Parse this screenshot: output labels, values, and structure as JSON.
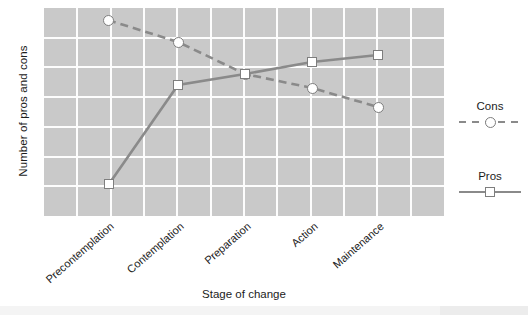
{
  "chart_data": {
    "type": "line",
    "title": "",
    "xlabel": "Stage of change",
    "ylabel": "Number of pros and cons",
    "categories": [
      "Precontemplation",
      "Contemplation",
      "Preparation",
      "Action",
      "Maintenance"
    ],
    "grid": true,
    "grid_color": "#fdfdfd",
    "plot_background": "#c9c9c9",
    "legend_position": "right",
    "ylim": [
      0,
      7
    ],
    "yticks_visible": false,
    "series": [
      {
        "name": "Cons",
        "style": "dashed",
        "marker": "circle",
        "color": "#8a8a8a",
        "values": [
          6.6,
          5.85,
          4.8,
          4.3,
          3.65
        ],
        "points_px": [
          {
            "x": 108,
            "y": 20
          },
          {
            "x": 178,
            "y": 42
          },
          {
            "x": 245,
            "y": 74
          },
          {
            "x": 312,
            "y": 88
          },
          {
            "x": 378,
            "y": 107
          }
        ]
      },
      {
        "name": "Pros",
        "style": "solid",
        "marker": "square",
        "color": "#8a8a8a",
        "values": [
          0.95,
          4.4,
          4.8,
          5.2,
          5.45
        ],
        "points_px": [
          {
            "x": 109,
            "y": 184
          },
          {
            "x": 178,
            "y": 85
          },
          {
            "x": 245,
            "y": 74
          },
          {
            "x": 312,
            "y": 62
          },
          {
            "x": 378,
            "y": 55
          }
        ]
      }
    ]
  },
  "axes": {
    "y_title": "Number of pros and cons",
    "x_title": "Stage of change",
    "x_tick_labels": [
      "Precontemplation",
      "Contemplation",
      "Preparation",
      "Action",
      "Maintenance"
    ]
  },
  "legend": {
    "entries": [
      {
        "label": "Cons",
        "style": "dashed",
        "marker": "circle"
      },
      {
        "label": "Pros",
        "style": "solid",
        "marker": "square"
      }
    ]
  }
}
